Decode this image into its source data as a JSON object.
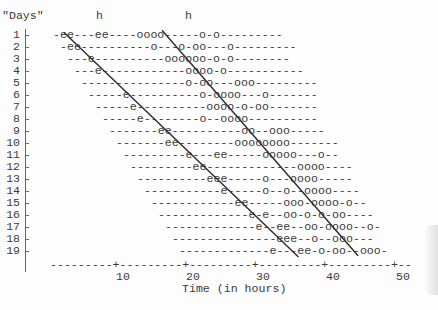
{
  "chart_data": {
    "type": "scatter",
    "subtype": "actogram (typewriter raster plot)",
    "title": "",
    "ylabel": "\"Days\"",
    "xlabel": "Time (in hours)",
    "column_markers": [
      "h",
      "h"
    ],
    "x_ticks": [
      10,
      20,
      30,
      40,
      50
    ],
    "y_ticks": [
      1,
      2,
      3,
      4,
      5,
      6,
      7,
      8,
      9,
      10,
      11,
      12,
      13,
      14,
      15,
      16,
      17,
      18,
      19
    ],
    "xlim": [
      0,
      52
    ],
    "ylim": [
      19,
      1
    ],
    "legend": {
      "e": "event type e",
      "o": "event type o"
    },
    "rows": [
      {
        "day": 1,
        "offset_chars": 0,
        "text": "-ee---ee----oooo-----o-o---------"
      },
      {
        "day": 2,
        "offset_chars": 1,
        "text": "-ee----------o---o-oo---o---------"
      },
      {
        "day": 3,
        "offset_chars": 2,
        "text": "---e----------oooooo-o-o--------"
      },
      {
        "day": 4,
        "offset_chars": 3,
        "text": "---e------------oooo-o-----------"
      },
      {
        "day": 5,
        "offset_chars": 4,
        "text": "---------------o-oo---ooo---------"
      },
      {
        "day": 6,
        "offset_chars": 5,
        "text": "-----e----------o-oooo---o-------"
      },
      {
        "day": 7,
        "offset_chars": 6,
        "text": "-----e----------oooo-o-oo-------"
      },
      {
        "day": 8,
        "offset_chars": 7,
        "text": "-----e--------o--oooo----------"
      },
      {
        "day": 9,
        "offset_chars": 8,
        "text": "-------ee----------oo--ooo-----"
      },
      {
        "day": 10,
        "offset_chars": 9,
        "text": "-------ee--------oooooooo-------"
      },
      {
        "day": 11,
        "offset_chars": 10,
        "text": "---------e---ee-----ooooo---o--"
      },
      {
        "day": 12,
        "offset_chars": 11,
        "text": "---------ee-------------oooo----"
      },
      {
        "day": 13,
        "offset_chars": 12,
        "text": "----------eee-----o---oooo-----"
      },
      {
        "day": 14,
        "offset_chars": 13,
        "text": "-----------e-----o--o--oooo----"
      },
      {
        "day": 15,
        "offset_chars": 14,
        "text": "------------ee-----ooo-oooo-o--"
      },
      {
        "day": 16,
        "offset_chars": 15,
        "text": "-------------e-e--oo-o-o-oo----"
      },
      {
        "day": 17,
        "offset_chars": 16,
        "text": "-------------e--ee--oo-oooo--o-"
      },
      {
        "day": 18,
        "offset_chars": 17,
        "text": "---------------eee--o--ooo---"
      },
      {
        "day": 19,
        "offset_chars": 18,
        "text": "-------------e---ee-o-oo--ooo-"
      }
    ],
    "x_axis_text": "---------+---------+---------+---------+---------+--",
    "trend_lines": [
      {
        "name": "line-1",
        "from": {
          "hour": 2.0,
          "day": 0.8
        },
        "to": {
          "hour": 35.5,
          "day": 19.5
        }
      },
      {
        "name": "line-2",
        "from": {
          "hour": 16.0,
          "day": 0.6
        },
        "to": {
          "hour": 44.0,
          "day": 19.4
        }
      }
    ]
  },
  "labels": {
    "y_axis_title": "\"Days\"",
    "x_axis_title": "Time (in hours)",
    "h_marker_1": "h",
    "h_marker_2": "h"
  }
}
